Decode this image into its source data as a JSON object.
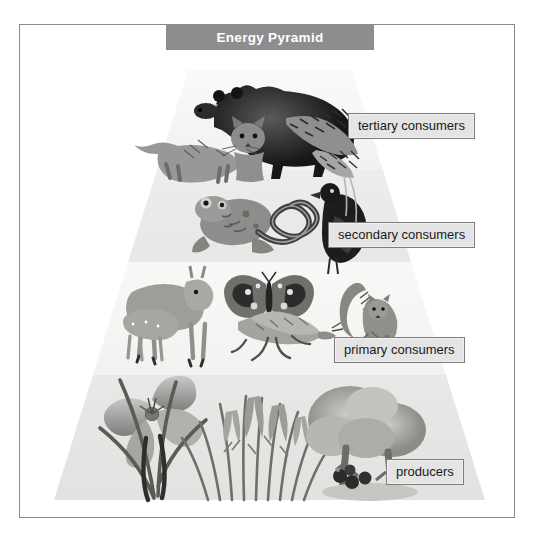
{
  "figure": {
    "title": "Energy Pyramid",
    "type": "trophic-energy-pyramid",
    "frame": {
      "border_color": "#8a8a8a",
      "background": "#ffffff"
    },
    "title_bar": {
      "background": "#8d8d8d",
      "text_color": "#ffffff"
    }
  },
  "levels": [
    {
      "id": "tertiary",
      "label": "tertiary consumers",
      "rank": 4,
      "tier_from_top": 1,
      "fill": "#f4f4f4",
      "organisms": [
        "black bear",
        "fox",
        "bobcat",
        "hawk"
      ]
    },
    {
      "id": "secondary",
      "label": "secondary consumers",
      "rank": 3,
      "tier_from_top": 2,
      "fill": "#ececeb",
      "organisms": [
        "frog",
        "snake",
        "blackbird"
      ]
    },
    {
      "id": "primary",
      "label": "primary consumers",
      "rank": 2,
      "tier_from_top": 3,
      "fill": "#f6f6f5",
      "organisms": [
        "deer",
        "fawn",
        "butterfly",
        "grasshopper",
        "squirrel"
      ]
    },
    {
      "id": "producers",
      "label": "producers",
      "rank": 1,
      "tier_from_top": 4,
      "fill": "#e6e6e4",
      "organisms": [
        "lily flower",
        "grasses",
        "tree"
      ]
    }
  ],
  "label_style": {
    "background": "#e4e4e4",
    "border_color": "#7d7d7d",
    "text_color": "#1a1a1a"
  }
}
